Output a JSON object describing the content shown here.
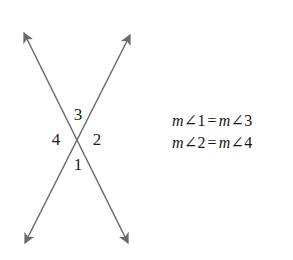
{
  "figure": {
    "name": "vertical-angles-figure",
    "background_color": "#ffffff",
    "line_color": "#6b6b6b",
    "text_color": "#1c1c1c"
  },
  "diagram": {
    "name": "intersecting-lines-diagram",
    "intersection": {
      "x": 77,
      "y": 141
    },
    "lines": [
      {
        "name": "line-upper-left-to-lower-right",
        "from": {
          "x": 24,
          "y": 33
        },
        "to": {
          "x": 128,
          "y": 243
        }
      },
      {
        "name": "line-lower-left-to-upper-right",
        "from": {
          "x": 25,
          "y": 243
        },
        "to": {
          "x": 130,
          "y": 35
        }
      }
    ],
    "arrowheads": [
      {
        "name": "arrowhead-top-left",
        "x": 24,
        "y": 33
      },
      {
        "name": "arrowhead-top-right",
        "x": 130,
        "y": 35
      },
      {
        "name": "arrowhead-bottom-left",
        "x": 25,
        "y": 243
      },
      {
        "name": "arrowhead-bottom-right",
        "x": 128,
        "y": 243
      }
    ],
    "angle_labels": [
      {
        "id": "3",
        "text": "3",
        "position": "top"
      },
      {
        "id": "4",
        "text": "4",
        "position": "left"
      },
      {
        "id": "2",
        "text": "2",
        "position": "right"
      },
      {
        "id": "1",
        "text": "1",
        "position": "bottom"
      }
    ]
  },
  "equations": {
    "name": "vertical-angle-equations",
    "lines": [
      {
        "text": "m∠1 = m∠3",
        "left": {
          "measure": "m",
          "angle_symbol": "∠",
          "number": "1"
        },
        "relation": "=",
        "right": {
          "measure": "m",
          "angle_symbol": "∠",
          "number": "3"
        }
      },
      {
        "text": "m∠2 = m∠4",
        "left": {
          "measure": "m",
          "angle_symbol": "∠",
          "number": "2"
        },
        "relation": "=",
        "right": {
          "measure": "m",
          "angle_symbol": "∠",
          "number": "4"
        }
      }
    ]
  }
}
